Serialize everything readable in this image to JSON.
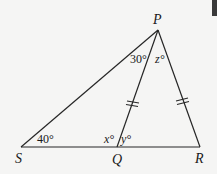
{
  "diagram": {
    "type": "triangle-geometry",
    "colors": {
      "background": "#f5f5f4",
      "stroke": "#262626",
      "text": "#1a1a1a"
    },
    "vertices": {
      "P": {
        "label": "P",
        "x": 158,
        "y": 30
      },
      "S": {
        "label": "S",
        "x": 21,
        "y": 147
      },
      "Q": {
        "label": "Q",
        "x": 117,
        "y": 147
      },
      "R": {
        "label": "R",
        "x": 200,
        "y": 147
      }
    },
    "segments": [
      "PS",
      "PQ",
      "PR",
      "SR"
    ],
    "congruent_marks": [
      {
        "segment": "PQ",
        "marks": 2
      },
      {
        "segment": "PR",
        "marks": 2
      }
    ],
    "angles": {
      "angle_SPQ": "30°",
      "angle_QPR": "z°",
      "angle_PSQ": "40°",
      "angle_PQS": "x°",
      "angle_PQR": "y°"
    },
    "angle_parts": {
      "z_var": "z",
      "x_var": "x",
      "y_var": "y",
      "degree": "°"
    }
  }
}
